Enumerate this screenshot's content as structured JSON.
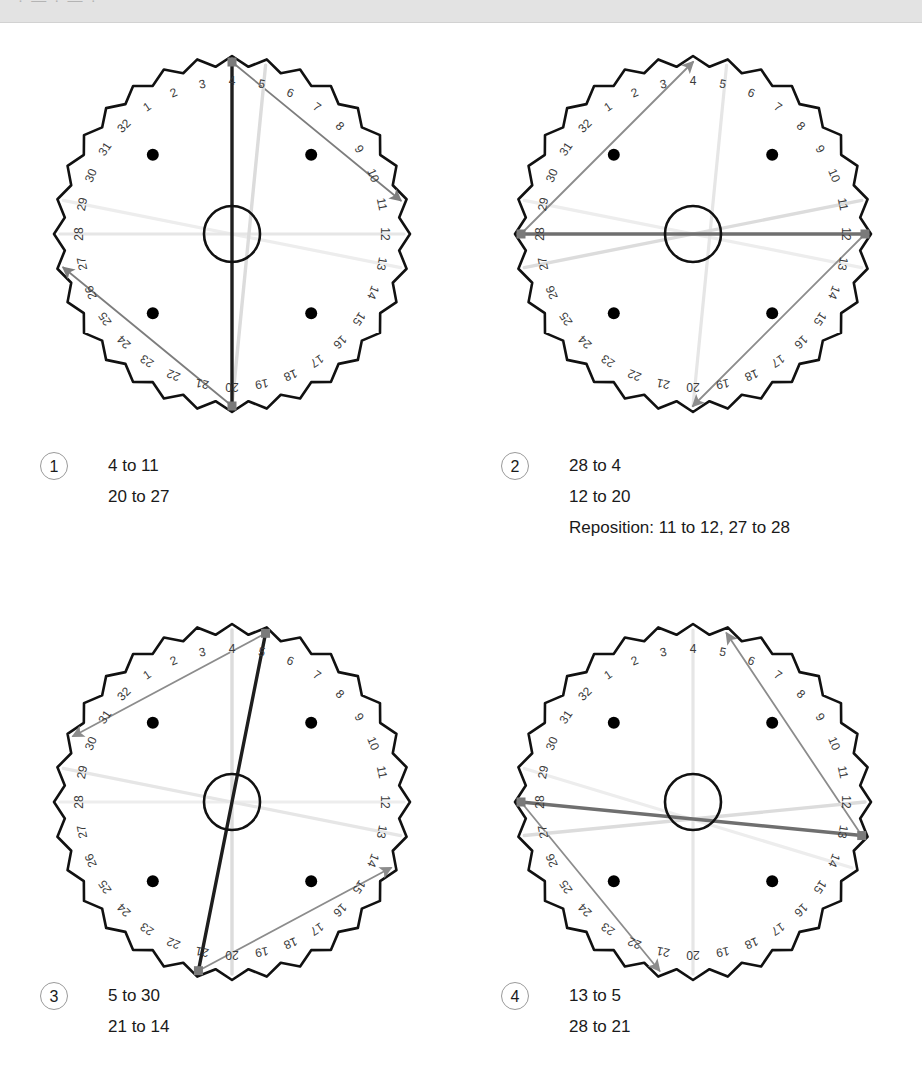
{
  "page": {
    "top_band_ghost_text": "· — · — ·",
    "background": "#ffffff",
    "band_color": "#e3e3e3"
  },
  "wheel": {
    "tick_count": 32,
    "labels": [
      "1",
      "2",
      "3",
      "4",
      "5",
      "6",
      "7",
      "8",
      "9",
      "10",
      "11",
      "12",
      "13",
      "14",
      "15",
      "16",
      "17",
      "18",
      "19",
      "20",
      "21",
      "22",
      "23",
      "24",
      "25",
      "26",
      "27",
      "28",
      "29",
      "30",
      "31",
      "32"
    ],
    "hub_label": "",
    "dot_count": 4,
    "outline_color": "#111111",
    "label_color": "#3a3a3a"
  },
  "colors": {
    "dark": "#1e1e1e",
    "mid_gray": "#6f6f6f",
    "light_gray": "#bfbfbf",
    "pale_gray": "#e2e2e2",
    "very_pale": "#ededed",
    "dot": "#000000",
    "badge_border": "#9a9a9a"
  },
  "panels": [
    {
      "id": "panel-1",
      "number": "1",
      "lines": [
        "4 to 11",
        "20 to 27"
      ],
      "diagram": {
        "connections": [
          {
            "name": "dark-chord-4-20",
            "from": 4,
            "to": 20,
            "color": "#1e1e1e",
            "width": 3.4,
            "arrow": false,
            "endpoints": true
          },
          {
            "name": "pale-chord-5-20",
            "from": 5,
            "to": 20,
            "color": "#dcdcdc",
            "width": 3.4,
            "arrow": false,
            "endpoints": false
          },
          {
            "name": "arrow-4-to-11",
            "from": 4,
            "to": 11,
            "color": "#7d7d7d",
            "width": 1.8,
            "arrow": true,
            "endpoints": false
          },
          {
            "name": "arrow-20-to-27",
            "from": 20,
            "to": 27,
            "color": "#7d7d7d",
            "width": 1.8,
            "arrow": true,
            "endpoints": false
          },
          {
            "name": "pale-chord-28-12",
            "from": 28,
            "to": 12,
            "color": "#e6e6e6",
            "width": 3.2,
            "arrow": false,
            "endpoints": false
          },
          {
            "name": "pale-chord-29-13",
            "from": 29,
            "to": 13,
            "color": "#ededed",
            "width": 3.2,
            "arrow": false,
            "endpoints": false
          }
        ]
      }
    },
    {
      "id": "panel-2",
      "number": "2",
      "lines": [
        "28 to 4",
        "12 to 20",
        "Reposition: 11 to 12, 27 to 28"
      ],
      "diagram": {
        "connections": [
          {
            "name": "mid-chord-28-12",
            "from": 28,
            "to": 12,
            "color": "#6f6f6f",
            "width": 3.6,
            "arrow": false,
            "endpoints": true
          },
          {
            "name": "pale-chord-27-11",
            "from": 27,
            "to": 11,
            "color": "#dcdcdc",
            "width": 3.4,
            "arrow": false,
            "endpoints": false
          },
          {
            "name": "arrow-28-to-4",
            "from": 28,
            "to": 4,
            "color": "#8c8c8c",
            "width": 1.8,
            "arrow": true,
            "endpoints": false
          },
          {
            "name": "arrow-12-to-20",
            "from": 12,
            "to": 20,
            "color": "#8c8c8c",
            "width": 1.8,
            "arrow": true,
            "endpoints": false
          },
          {
            "name": "pale-chord-5-20",
            "from": 5,
            "to": 20,
            "color": "#e6e6e6",
            "width": 3.2,
            "arrow": false,
            "endpoints": false
          },
          {
            "name": "pale-chord-29-13",
            "from": 29,
            "to": 13,
            "color": "#ededed",
            "width": 3.2,
            "arrow": false,
            "endpoints": false
          }
        ]
      }
    },
    {
      "id": "panel-3",
      "number": "3",
      "lines": [
        "5 to 30",
        "21 to 14"
      ],
      "diagram": {
        "connections": [
          {
            "name": "dark-chord-5-21",
            "from": 5,
            "to": 21,
            "color": "#1e1e1e",
            "width": 3.4,
            "arrow": false,
            "endpoints": true
          },
          {
            "name": "pale-chord-4-20",
            "from": 4,
            "to": 20,
            "color": "#dcdcdc",
            "width": 3.4,
            "arrow": false,
            "endpoints": false
          },
          {
            "name": "arrow-5-to-30",
            "from": 5,
            "to": 30,
            "color": "#8c8c8c",
            "width": 1.8,
            "arrow": true,
            "endpoints": false
          },
          {
            "name": "arrow-21-to-14",
            "from": 21,
            "to": 14,
            "color": "#8c8c8c",
            "width": 1.8,
            "arrow": true,
            "endpoints": false
          },
          {
            "name": "pale-chord-29-13",
            "from": 29,
            "to": 13,
            "color": "#e6e6e6",
            "width": 3.2,
            "arrow": false,
            "endpoints": false
          },
          {
            "name": "pale-chord-28-12",
            "from": 28,
            "to": 12,
            "color": "#ededed",
            "width": 3.2,
            "arrow": false,
            "endpoints": false
          }
        ]
      }
    },
    {
      "id": "panel-4",
      "number": "4",
      "lines": [
        "13 to 5",
        "28 to 21"
      ],
      "diagram": {
        "connections": [
          {
            "name": "mid-chord-28-13",
            "from": 28,
            "to": 13,
            "color": "#6f6f6f",
            "width": 3.6,
            "arrow": false,
            "endpoints": true
          },
          {
            "name": "pale-chord-27-12",
            "from": 27,
            "to": 12,
            "color": "#dcdcdc",
            "width": 3.4,
            "arrow": false,
            "endpoints": false
          },
          {
            "name": "arrow-13-to-5",
            "from": 13,
            "to": 5,
            "color": "#8c8c8c",
            "width": 1.8,
            "arrow": true,
            "endpoints": false
          },
          {
            "name": "arrow-28-to-21",
            "from": 28,
            "to": 21,
            "color": "#8c8c8c",
            "width": 1.8,
            "arrow": true,
            "endpoints": false
          },
          {
            "name": "pale-chord-4-20",
            "from": 4,
            "to": 20,
            "color": "#e6e6e6",
            "width": 3.2,
            "arrow": false,
            "endpoints": false
          },
          {
            "name": "pale-chord-29-14",
            "from": 29,
            "to": 14,
            "color": "#ededed",
            "width": 3.2,
            "arrow": false,
            "endpoints": false
          }
        ]
      }
    }
  ]
}
